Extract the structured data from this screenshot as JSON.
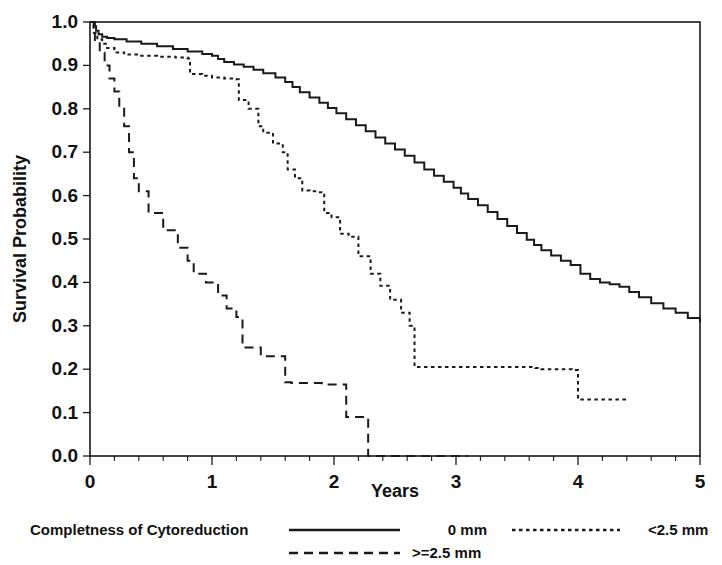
{
  "chart_data": {
    "type": "line",
    "title": "",
    "subtitle": "",
    "xlabel": "Years",
    "ylabel": "Survival Probability",
    "xlim": [
      0,
      5
    ],
    "ylim": [
      0.0,
      1.0
    ],
    "grid": false,
    "legend_position": "bottom",
    "legend_title": "Completness of Cytoreduction",
    "x_ticks": [
      "0",
      "1",
      "2",
      "3",
      "4",
      "5"
    ],
    "x_tick_values": [
      0,
      1,
      2,
      3,
      4,
      5
    ],
    "x_minor_ticks_per_interval": 5,
    "y_ticks": [
      "0.0",
      "0.1",
      "0.2",
      "0.3",
      "0.4",
      "0.5",
      "0.6",
      "0.7",
      "0.8",
      "0.9",
      "1.0"
    ],
    "y_tick_values": [
      0.0,
      0.1,
      0.2,
      0.3,
      0.4,
      0.5,
      0.6,
      0.7,
      0.8,
      0.9,
      1.0
    ],
    "series": [
      {
        "name": "0 mm",
        "style": "solid",
        "color": "#1a1a1a",
        "points": [
          [
            0.0,
            1.0
          ],
          [
            0.04,
            0.992
          ],
          [
            0.06,
            0.985
          ],
          [
            0.08,
            0.978
          ],
          [
            0.1,
            0.972
          ],
          [
            0.13,
            0.968
          ],
          [
            0.16,
            0.965
          ],
          [
            0.22,
            0.962
          ],
          [
            0.3,
            0.959
          ],
          [
            0.38,
            0.956
          ],
          [
            0.46,
            0.952
          ],
          [
            0.55,
            0.948
          ],
          [
            0.63,
            0.944
          ],
          [
            0.7,
            0.94
          ],
          [
            0.78,
            0.935
          ],
          [
            0.86,
            0.93
          ],
          [
            0.94,
            0.926
          ],
          [
            1.0,
            0.922
          ],
          [
            1.08,
            0.918
          ],
          [
            1.14,
            0.914
          ],
          [
            1.2,
            0.91
          ],
          [
            1.26,
            0.905
          ],
          [
            1.32,
            0.898
          ],
          [
            1.38,
            0.891
          ],
          [
            1.44,
            0.884
          ],
          [
            1.5,
            0.878
          ],
          [
            1.56,
            0.872
          ],
          [
            1.62,
            0.866
          ],
          [
            1.7,
            0.858
          ],
          [
            1.78,
            0.85
          ],
          [
            1.86,
            0.842
          ],
          [
            1.94,
            0.834
          ],
          [
            2.0,
            0.826
          ],
          [
            2.06,
            0.818
          ],
          [
            2.12,
            0.81
          ],
          [
            2.18,
            0.802
          ],
          [
            2.24,
            0.794
          ],
          [
            2.3,
            0.786
          ],
          [
            2.36,
            0.778
          ],
          [
            2.42,
            0.77
          ],
          [
            2.48,
            0.762
          ],
          [
            2.54,
            0.754
          ],
          [
            2.6,
            0.746
          ],
          [
            2.66,
            0.738
          ],
          [
            2.72,
            0.73
          ],
          [
            2.78,
            0.722
          ],
          [
            2.84,
            0.713
          ],
          [
            2.9,
            0.705
          ],
          [
            2.96,
            0.697
          ],
          [
            3.02,
            0.689
          ],
          [
            3.06,
            0.681
          ],
          [
            3.1,
            0.672
          ],
          [
            3.16,
            0.664
          ],
          [
            3.22,
            0.656
          ],
          [
            3.28,
            0.648
          ],
          [
            3.34,
            0.64
          ],
          [
            3.4,
            0.631
          ],
          [
            3.46,
            0.622
          ],
          [
            3.52,
            0.613
          ],
          [
            3.58,
            0.604
          ],
          [
            3.64,
            0.596
          ],
          [
            3.7,
            0.588
          ],
          [
            3.76,
            0.58
          ],
          [
            3.82,
            0.572
          ],
          [
            3.88,
            0.564
          ],
          [
            3.94,
            0.556
          ],
          [
            4.0,
            0.547
          ],
          [
            4.06,
            0.538
          ],
          [
            4.12,
            0.529
          ],
          [
            4.18,
            0.52
          ],
          [
            4.24,
            0.511
          ],
          [
            4.3,
            0.502
          ],
          [
            4.36,
            0.494
          ],
          [
            4.42,
            0.487
          ],
          [
            4.48,
            0.48
          ],
          [
            4.54,
            0.474
          ],
          [
            4.6,
            0.468
          ],
          [
            4.7,
            0.462
          ],
          [
            4.8,
            0.456
          ],
          [
            4.9,
            0.45
          ],
          [
            5.0,
            0.445
          ],
          [
            5.1,
            0.44
          ],
          [
            5.2,
            0.434
          ],
          [
            5.3,
            0.428
          ],
          [
            5.4,
            0.422
          ],
          [
            5.5,
            0.416
          ],
          [
            5.6,
            0.411
          ],
          [
            5.7,
            0.406
          ],
          [
            5.8,
            0.402
          ],
          [
            5.9,
            0.399
          ],
          [
            6.0,
            0.396
          ]
        ]
      }
    ],
    "series_time_scale_note": "series points use internal index; actual plotted curves given in curves_xy",
    "curves_xy": {
      "0 mm": {
        "style": "solid",
        "x": [
          0.0,
          0.03,
          0.05,
          0.07,
          0.1,
          0.14,
          0.2,
          0.3,
          0.42,
          0.55,
          0.68,
          0.8,
          0.92,
          1.0,
          1.05,
          1.1,
          1.18,
          1.26,
          1.34,
          1.42,
          1.52,
          1.6,
          1.66,
          1.72,
          1.8,
          1.88,
          1.95,
          2.02,
          2.1,
          2.18,
          2.26,
          2.34,
          2.42,
          2.5,
          2.58,
          2.66,
          2.74,
          2.82,
          2.9,
          2.98,
          3.04,
          3.1,
          3.18,
          3.26,
          3.34,
          3.42,
          3.5,
          3.58,
          3.64,
          3.7,
          3.78,
          3.86,
          3.94,
          4.02,
          4.1,
          4.18,
          4.26,
          4.34,
          4.42,
          4.5,
          4.6,
          4.7,
          4.8,
          4.9,
          5.0
        ],
        "y": [
          1.0,
          0.99,
          0.98,
          0.972,
          0.966,
          0.963,
          0.96,
          0.955,
          0.95,
          0.944,
          0.938,
          0.932,
          0.926,
          0.922,
          0.915,
          0.908,
          0.902,
          0.897,
          0.89,
          0.882,
          0.872,
          0.862,
          0.85,
          0.838,
          0.826,
          0.814,
          0.802,
          0.79,
          0.776,
          0.762,
          0.748,
          0.734,
          0.72,
          0.706,
          0.692,
          0.676,
          0.66,
          0.646,
          0.632,
          0.618,
          0.605,
          0.592,
          0.578,
          0.562,
          0.546,
          0.53,
          0.514,
          0.498,
          0.486,
          0.474,
          0.462,
          0.45,
          0.44,
          0.42,
          0.408,
          0.4,
          0.396,
          0.39,
          0.378,
          0.366,
          0.352,
          0.34,
          0.33,
          0.318,
          0.308,
          0.3,
          0.292,
          0.286
        ]
      },
      "<2.5 mm": {
        "style": "dotted",
        "x": [
          0.0,
          0.03,
          0.06,
          0.1,
          0.14,
          0.2,
          0.28,
          0.4,
          0.55,
          0.7,
          0.8,
          0.82,
          0.92,
          1.0,
          1.1,
          1.18,
          1.22,
          1.3,
          1.38,
          1.42,
          1.5,
          1.58,
          1.62,
          1.68,
          1.74,
          1.8,
          1.86,
          1.92,
          1.98,
          2.05,
          2.12,
          2.2,
          2.3,
          2.38,
          2.46,
          2.55,
          2.62,
          2.66,
          3.65,
          3.7,
          3.95,
          4.0,
          4.4
        ],
        "y": [
          1.0,
          0.975,
          0.96,
          0.95,
          0.94,
          0.93,
          0.925,
          0.922,
          0.92,
          0.918,
          0.916,
          0.88,
          0.876,
          0.872,
          0.87,
          0.868,
          0.82,
          0.8,
          0.76,
          0.745,
          0.72,
          0.7,
          0.66,
          0.64,
          0.612,
          0.61,
          0.608,
          0.56,
          0.55,
          0.512,
          0.505,
          0.46,
          0.42,
          0.392,
          0.36,
          0.33,
          0.3,
          0.205,
          0.203,
          0.2,
          0.198,
          0.13,
          0.13
        ]
      },
      ">=2.5 mm": {
        "style": "dashed",
        "x": [
          0.0,
          0.04,
          0.08,
          0.12,
          0.16,
          0.2,
          0.24,
          0.28,
          0.32,
          0.36,
          0.4,
          0.48,
          0.6,
          0.72,
          0.8,
          0.85,
          0.95,
          1.05,
          1.12,
          1.2,
          1.25,
          1.4,
          1.6,
          1.65,
          1.9,
          2.1,
          2.25,
          2.28,
          3.1
        ],
        "y": [
          1.0,
          0.955,
          0.93,
          0.9,
          0.87,
          0.84,
          0.8,
          0.76,
          0.7,
          0.64,
          0.61,
          0.56,
          0.52,
          0.48,
          0.45,
          0.42,
          0.4,
          0.37,
          0.34,
          0.32,
          0.25,
          0.23,
          0.17,
          0.168,
          0.165,
          0.09,
          0.088,
          0.0,
          0.0
        ]
      }
    },
    "legend_entries": [
      {
        "label": "0 mm",
        "style": "solid"
      },
      {
        "label": "<2.5 mm",
        "style": "dotted"
      },
      {
        "label": ">=2.5 mm",
        "style": "dashed"
      }
    ]
  }
}
